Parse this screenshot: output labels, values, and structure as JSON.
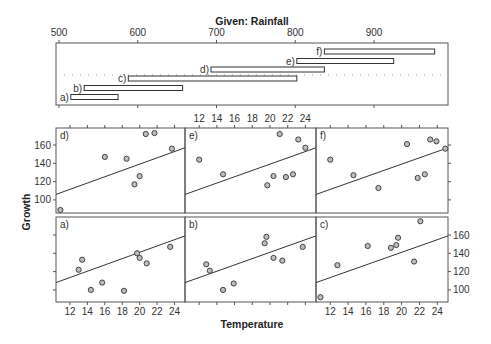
{
  "chart_data": {
    "type": "scatter",
    "title": "Given: Rainfall",
    "xlabel": "Temperature",
    "ylabel": "Growth",
    "layout": "coplot 3x2",
    "given": {
      "label": "Given: Rainfall",
      "axis_ticks": [
        500,
        600,
        700,
        800,
        900
      ],
      "axis_range": [
        490,
        990
      ],
      "intervals": [
        {
          "name": "a)",
          "from": 515,
          "to": 575
        },
        {
          "name": "b)",
          "from": 532,
          "to": 657
        },
        {
          "name": "c)",
          "from": 588,
          "to": 802
        },
        {
          "name": "d)",
          "from": 693,
          "to": 837
        },
        {
          "name": "e)",
          "from": 802,
          "to": 925
        },
        {
          "name": "f)",
          "from": 837,
          "to": 977
        }
      ]
    },
    "x_ticks": [
      12,
      14,
      16,
      18,
      20,
      22,
      24
    ],
    "x_range": [
      10.4,
      25.2
    ],
    "y_ticks": [
      100,
      120,
      140,
      160
    ],
    "y_range": [
      88,
      180
    ],
    "grid": false,
    "panels": [
      {
        "name": "d)",
        "points": [
          [
            10.9,
            89
          ],
          [
            16.0,
            147
          ],
          [
            18.5,
            145
          ],
          [
            19.4,
            117
          ],
          [
            20.0,
            126
          ],
          [
            20.7,
            172
          ],
          [
            21.7,
            173
          ],
          [
            23.7,
            156
          ]
        ],
        "fit": [
          [
            10.4,
            106
          ],
          [
            25.2,
            157
          ]
        ]
      },
      {
        "name": "e)",
        "points": [
          [
            12.0,
            144
          ],
          [
            14.7,
            128
          ],
          [
            19.7,
            116
          ],
          [
            20.4,
            126
          ],
          [
            21.1,
            172
          ],
          [
            21.8,
            125
          ],
          [
            22.6,
            128
          ],
          [
            23.2,
            166
          ],
          [
            24.0,
            157
          ]
        ],
        "fit": [
          [
            10.4,
            106
          ],
          [
            25.2,
            157
          ]
        ]
      },
      {
        "name": "f)",
        "points": [
          [
            12.0,
            144
          ],
          [
            14.6,
            127
          ],
          [
            17.4,
            113
          ],
          [
            20.6,
            161
          ],
          [
            21.8,
            124
          ],
          [
            22.6,
            128
          ],
          [
            23.2,
            166
          ],
          [
            23.9,
            164
          ],
          [
            24.9,
            156
          ]
        ],
        "fit": [
          [
            10.4,
            106
          ],
          [
            25.2,
            157
          ]
        ]
      },
      {
        "name": "a)",
        "points": [
          [
            13.0,
            122
          ],
          [
            13.4,
            133
          ],
          [
            14.4,
            100
          ],
          [
            15.7,
            108
          ],
          [
            18.2,
            99
          ],
          [
            19.7,
            140
          ],
          [
            20.0,
            135
          ],
          [
            20.8,
            129
          ],
          [
            23.5,
            147
          ]
        ],
        "fit": [
          [
            10.4,
            108
          ],
          [
            25.2,
            159
          ]
        ]
      },
      {
        "name": "b)",
        "points": [
          [
            12.8,
            128
          ],
          [
            13.2,
            121
          ],
          [
            14.7,
            100
          ],
          [
            15.9,
            107
          ],
          [
            19.4,
            151
          ],
          [
            19.6,
            158
          ],
          [
            20.4,
            135
          ],
          [
            21.4,
            132
          ],
          [
            23.7,
            147
          ]
        ],
        "fit": [
          [
            10.4,
            108
          ],
          [
            25.2,
            159
          ]
        ]
      },
      {
        "name": "c)",
        "points": [
          [
            10.9,
            92
          ],
          [
            12.8,
            127
          ],
          [
            16.2,
            148
          ],
          [
            18.8,
            146
          ],
          [
            19.4,
            149
          ],
          [
            19.6,
            157
          ],
          [
            21.4,
            131
          ],
          [
            22.1,
            175
          ]
        ],
        "fit": [
          [
            10.4,
            108
          ],
          [
            25.2,
            159
          ]
        ]
      }
    ]
  }
}
